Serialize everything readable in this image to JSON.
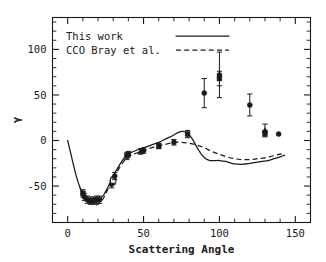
{
  "chart_data": {
    "type": "scatter",
    "title": "",
    "xlabel": "Scattering Angle",
    "ylabel": "γ",
    "xlim": [
      -10,
      160
    ],
    "ylim": [
      -90,
      135
    ],
    "xticks": [
      0,
      50,
      100,
      150
    ],
    "xtick_labels": [
      "0",
      "50",
      "100",
      "150"
    ],
    "xtick_minor_step": 10,
    "yticks": [
      100,
      50,
      0,
      -50
    ],
    "ytick_labels": [
      "100",
      "50",
      "0",
      "-50"
    ],
    "ytick_minor_step": 10,
    "grid": false,
    "legend_position": "top-left",
    "legend": [
      {
        "label": "This work",
        "style": "solid-line"
      },
      {
        "label": "CCO Bray et al.",
        "style": "dashed-line"
      }
    ],
    "series": [
      {
        "name": "This work",
        "type": "line",
        "style": "solid",
        "points": [
          [
            0,
            0
          ],
          [
            2,
            -14
          ],
          [
            4,
            -28
          ],
          [
            6,
            -41
          ],
          [
            8,
            -51
          ],
          [
            10,
            -58
          ],
          [
            12,
            -63
          ],
          [
            14,
            -66
          ],
          [
            16,
            -67
          ],
          [
            18,
            -67
          ],
          [
            20,
            -66
          ],
          [
            22,
            -63
          ],
          [
            24,
            -59
          ],
          [
            26,
            -53
          ],
          [
            28,
            -46
          ],
          [
            30,
            -39
          ],
          [
            33,
            -30
          ],
          [
            36,
            -22
          ],
          [
            39,
            -16
          ],
          [
            42,
            -13
          ],
          [
            45,
            -11
          ],
          [
            50,
            -8
          ],
          [
            55,
            -5
          ],
          [
            60,
            -2
          ],
          [
            65,
            2
          ],
          [
            70,
            6
          ],
          [
            73,
            9
          ],
          [
            76,
            10
          ],
          [
            79,
            8
          ],
          [
            82,
            2
          ],
          [
            85,
            -7
          ],
          [
            88,
            -15
          ],
          [
            91,
            -20
          ],
          [
            94,
            -22
          ],
          [
            97,
            -22
          ],
          [
            100,
            -22
          ],
          [
            104,
            -23
          ],
          [
            108,
            -25
          ],
          [
            112,
            -26
          ],
          [
            116,
            -26
          ],
          [
            120,
            -25
          ],
          [
            124,
            -24
          ],
          [
            128,
            -23
          ],
          [
            132,
            -22
          ],
          [
            136,
            -20
          ],
          [
            140,
            -18
          ],
          [
            143,
            -16
          ]
        ]
      },
      {
        "name": "CCO Bray et al.",
        "type": "line",
        "style": "dashed",
        "points": [
          [
            8,
            -52
          ],
          [
            10,
            -58
          ],
          [
            12,
            -63
          ],
          [
            14,
            -67
          ],
          [
            16,
            -70
          ],
          [
            18,
            -71
          ],
          [
            20,
            -70
          ],
          [
            22,
            -67
          ],
          [
            24,
            -62
          ],
          [
            26,
            -55
          ],
          [
            28,
            -48
          ],
          [
            30,
            -42
          ],
          [
            33,
            -33
          ],
          [
            36,
            -25
          ],
          [
            39,
            -19
          ],
          [
            42,
            -16
          ],
          [
            45,
            -14
          ],
          [
            50,
            -11
          ],
          [
            55,
            -8
          ],
          [
            60,
            -6
          ],
          [
            65,
            -4
          ],
          [
            70,
            -2
          ],
          [
            75,
            -2
          ],
          [
            80,
            -3
          ],
          [
            85,
            -5
          ],
          [
            90,
            -8
          ],
          [
            95,
            -12
          ],
          [
            100,
            -15
          ],
          [
            105,
            -18
          ],
          [
            110,
            -20
          ],
          [
            115,
            -21
          ],
          [
            120,
            -21
          ],
          [
            125,
            -20
          ],
          [
            130,
            -19
          ],
          [
            135,
            -17
          ],
          [
            140,
            -15
          ],
          [
            143,
            -14
          ]
        ]
      }
    ],
    "data_points": [
      {
        "x": 10,
        "y": -58,
        "yerr": 4,
        "marker": "square"
      },
      {
        "x": 11,
        "y": -62,
        "yerr": 4,
        "marker": "circle"
      },
      {
        "x": 13,
        "y": -65,
        "yerr": 4,
        "marker": "circle"
      },
      {
        "x": 15,
        "y": -66,
        "yerr": 4,
        "marker": "square"
      },
      {
        "x": 17,
        "y": -66,
        "yerr": 4,
        "marker": "circle"
      },
      {
        "x": 19,
        "y": -65,
        "yerr": 4,
        "marker": "square"
      },
      {
        "x": 21,
        "y": -65,
        "yerr": 4,
        "marker": "circle"
      },
      {
        "x": 29,
        "y": -48,
        "yerr": 4,
        "marker": "circle"
      },
      {
        "x": 30,
        "y": -44,
        "yerr": 4,
        "marker": "open-square"
      },
      {
        "x": 31,
        "y": -39,
        "yerr": 4,
        "marker": "circle"
      },
      {
        "x": 39,
        "y": -17,
        "yerr": 4,
        "marker": "square"
      },
      {
        "x": 40,
        "y": -15,
        "yerr": 3,
        "marker": "circle"
      },
      {
        "x": 48,
        "y": -12,
        "yerr": 3,
        "marker": "triangle"
      },
      {
        "x": 50,
        "y": -11,
        "yerr": 3,
        "marker": "circle"
      },
      {
        "x": 60,
        "y": -6,
        "yerr": 3,
        "marker": "square"
      },
      {
        "x": 70,
        "y": -2,
        "yerr": 3,
        "marker": "circle"
      },
      {
        "x": 79,
        "y": 7,
        "yerr": 4,
        "marker": "square"
      },
      {
        "x": 90,
        "y": 52,
        "yerr": 16,
        "marker": "circle"
      },
      {
        "x": 100,
        "y": 72,
        "yerr": 25,
        "marker": "circle"
      },
      {
        "x": 100,
        "y": 68,
        "yerr": 8,
        "marker": "square"
      },
      {
        "x": 120,
        "y": 39,
        "yerr": 12,
        "marker": "circle"
      },
      {
        "x": 130,
        "y": 11,
        "yerr": 7,
        "marker": "triangle"
      },
      {
        "x": 130,
        "y": 8,
        "yerr": 3,
        "marker": "square"
      },
      {
        "x": 139,
        "y": 7,
        "yerr": 0,
        "marker": "circle"
      }
    ]
  },
  "axes": {
    "x_title": "Scattering Angle",
    "y_title": "γ",
    "x_labels": [
      "0",
      "50",
      "100",
      "150"
    ],
    "y_labels": [
      "100",
      "50",
      "0",
      "-50"
    ]
  },
  "legend": {
    "entry_1": "This work",
    "entry_2": "CCO Bray et al."
  },
  "style": {
    "ink": "#1a1a1a",
    "background": "#ffffff"
  }
}
